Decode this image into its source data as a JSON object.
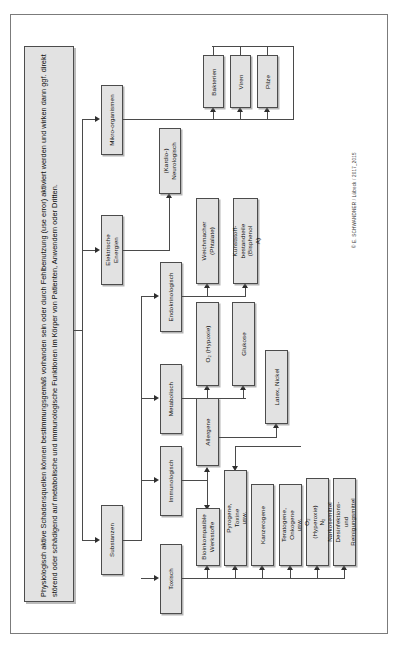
{
  "document": {
    "title": "Physiologisch aktive Schadensquellen – Übersicht",
    "orientation": "rotated-90",
    "copyright": "© E. SCHWANDNER / Lübeck / 2017_2015"
  },
  "intro": {
    "text": "Physiologisch aktive Schadensquellen können bestimmungsgemäß vorhanden sein oder durch Fehlbenutzung (use error) aktiviert werden und wirken dann ggf. direkt störend oder schädigend auf metabolische und immunologische Funktionen im Körper von Patienten, Anwendern oder Dritten."
  },
  "colors": {
    "box_fill": "#e2e2e2",
    "box_border": "#4c4c4c",
    "line": "#4a4a4a",
    "frame": "#7b7b7b",
    "page_bg": "#ffffff",
    "text": "#111111"
  },
  "nodes": {
    "level1": [
      {
        "id": "mikroorganismen",
        "label": "Mikro-organismen"
      },
      {
        "id": "elektrische_energien",
        "label": "Elektrische\nEnergien"
      },
      {
        "id": "substanzen",
        "label": "Substanzen"
      }
    ],
    "mikro_children": [
      {
        "id": "bakterien",
        "label": "Bakterien"
      },
      {
        "id": "viren",
        "label": "Viren"
      },
      {
        "id": "pilze",
        "label": "Pilze"
      }
    ],
    "elektrisch_children": [
      {
        "id": "kardio_neurologisch",
        "label": "(Kardio-)\nNeurologisch"
      }
    ],
    "substanzen_children": [
      {
        "id": "endokrinologisch",
        "label": "Endokrinologisch"
      },
      {
        "id": "metabolisch",
        "label": "Metabolisch"
      },
      {
        "id": "immunologisch",
        "label": "Immunologisch"
      },
      {
        "id": "toxisch",
        "label": "Toxisch"
      }
    ],
    "endokrinologisch_children": [
      {
        "id": "weichmacher",
        "label": "Weichmacher\n(Phtalate)"
      },
      {
        "id": "kunststoff",
        "label": "Kunststoff-\nbestandteile\n(Bisphenol A)"
      }
    ],
    "metabolisch_children": [
      {
        "id": "o2_hypoxie",
        "label": "O₂ (Hypoxie)"
      },
      {
        "id": "glukose",
        "label": "Glukose"
      }
    ],
    "immunologisch_children": [
      {
        "id": "allergene",
        "label": "Allergene"
      }
    ],
    "allergene_children": [
      {
        "id": "latex_nickel",
        "label": "Latex, Nickel"
      }
    ],
    "toxisch_children": [
      {
        "id": "bioinkompatible",
        "label": "Bioinkompatible\nWerkstoffe"
      },
      {
        "id": "pyrogene",
        "label": "Pyrogene, Toxine\nusw."
      },
      {
        "id": "kanzerogene",
        "label": "Kanzerogene"
      },
      {
        "id": "teratogene",
        "label": "Teratogene,\nOnkogene usw."
      },
      {
        "id": "o2_hyperoxie",
        "label": "O₂ (Hyperoxie)\nN₂ Narkosemittel"
      },
      {
        "id": "desinfektion",
        "label": "Desinfektions- und\nReinigungsmittel"
      }
    ]
  }
}
